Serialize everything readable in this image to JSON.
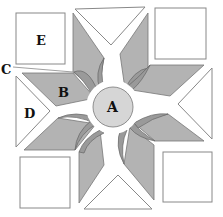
{
  "diagram": {
    "labels": {
      "A": "A",
      "B": "B",
      "C": "C",
      "D": "D",
      "E": "E"
    },
    "colors": {
      "background": "#ffffff",
      "petal": "#b3b3b3",
      "petal_inner": "#9a9a9a",
      "center": "#d6d6d6",
      "outline": "#777777",
      "white_shape": "#ffffff"
    }
  }
}
